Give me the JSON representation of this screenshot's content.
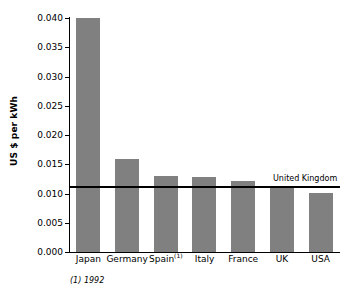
{
  "chart_data": {
    "type": "bar",
    "title": "",
    "subtitle": "",
    "xlabel": "",
    "ylabel": "US $ per kWh",
    "categories": [
      "Japan",
      "Germany",
      "Spain",
      "Italy",
      "France",
      "UK",
      "USA"
    ],
    "category_labels": [
      "Japan",
      "Germany",
      "Spain(1)",
      "Italy",
      "France",
      "UK",
      "USA"
    ],
    "category_footnote_markers": [
      "",
      "",
      "(1)",
      "",
      "",
      "",
      ""
    ],
    "values": [
      0.04,
      0.0159,
      0.013,
      0.0128,
      0.0122,
      0.0111,
      0.0101
    ],
    "ylim": [
      0.0,
      0.04
    ],
    "yticks": [
      0.0,
      0.005,
      0.01,
      0.015,
      0.02,
      0.025,
      0.03,
      0.035,
      0.04
    ],
    "ytick_labels": [
      "0.000",
      "0.005",
      "0.010",
      "0.015",
      "0.020",
      "0.025",
      "0.030",
      "0.035",
      "0.040"
    ],
    "grid": false,
    "legend": false,
    "bar_color": "#808080",
    "axis_color": "#000000",
    "background_color": "#ffffff",
    "annotations": [
      {
        "name": "united-kingdom-reference",
        "label": "United Kingdom",
        "type": "hline",
        "value": 0.0111,
        "color": "#000000"
      }
    ]
  },
  "footnote": {
    "text": "(1) 1992"
  }
}
